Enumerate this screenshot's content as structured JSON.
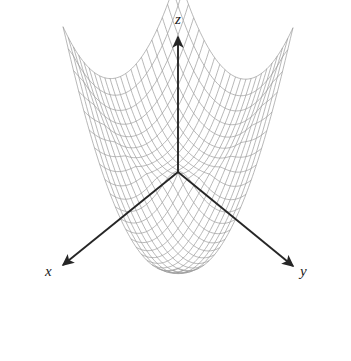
{
  "figure": {
    "title": "",
    "background_color": "#ffffff",
    "width": 351,
    "height": 361
  },
  "axes": {
    "z": {
      "label": "z",
      "color": "#262626",
      "origin_px": [
        178,
        172
      ],
      "tip_px": [
        178,
        37
      ],
      "arrow": true
    },
    "x": {
      "label": "x",
      "color": "#262626",
      "origin_px": [
        178,
        172
      ],
      "tip_px": [
        63,
        265
      ],
      "arrow": true
    },
    "y": {
      "label": "y",
      "color": "#262626",
      "origin_px": [
        178,
        172
      ],
      "tip_px": [
        293,
        266
      ],
      "arrow": true
    }
  },
  "chart_data": {
    "type": "surface",
    "title": "",
    "xlabel": "x",
    "ylabel": "y",
    "zlabel": "z",
    "grid": true,
    "legend": false,
    "surface": {
      "description": "downward-opening saddle / cusp surface, wireframe mesh, peaks at far left and far right corners, deep valley toward front along +x/+y bisector",
      "mesh_color": "#9a9a9a",
      "mesh_linewidth": 0.7,
      "fill": "none",
      "nu": 22,
      "nv": 22,
      "u_range": [
        -1,
        1
      ],
      "v_range": [
        -1,
        1
      ],
      "z_expression": "z = 1.15*(u*u + v*v) - 3.0*((u*u*v*v)**0.5 + 0.0) - 2.9*sqrt(u*u+v*v)*(1 - 0.5*(u+v)) ",
      "z_formula_label": "z = -(x^2 + y^2)^(2/3) style cusp surface",
      "zlim": [
        -1.0,
        0.35
      ]
    },
    "projection": {
      "type": "oblique-3d",
      "origin_px": [
        178,
        172
      ],
      "x_axis_px_per_unit": [
        -57.5,
        46.5
      ],
      "y_axis_px_per_unit": [
        57.5,
        47.0
      ],
      "z_axis_px_per_unit": [
        0,
        -95.0
      ]
    },
    "surface_extent_px": {
      "left_tip": [
        25,
        125
      ],
      "right_tip": [
        331,
        125
      ],
      "front_tip": [
        180,
        345
      ],
      "back_center_peak": [
        178,
        86
      ]
    }
  }
}
